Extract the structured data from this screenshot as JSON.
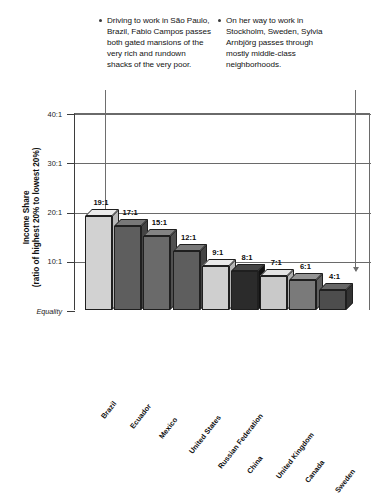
{
  "chart_data": {
    "type": "bar",
    "title": "",
    "xlabel": "",
    "ylabel": "Income Share",
    "ylabel_sub": "(ratio of highest 20% to lowest 20%)",
    "categories": [
      "Brazil",
      "Ecuador",
      "Mexico",
      "United States",
      "Russian Federation",
      "China",
      "United Kingdom",
      "Canada",
      "Sweden"
    ],
    "values": [
      19,
      17,
      15,
      12,
      9,
      8,
      7,
      6,
      4
    ],
    "value_labels": [
      "19:1",
      "17:1",
      "15:1",
      "12:1",
      "9:1",
      "8:1",
      "7:1",
      "6:1",
      "4:1"
    ],
    "ylim": [
      0,
      40
    ],
    "ytick_values": [
      40,
      30,
      20,
      10,
      0
    ],
    "ytick_labels": [
      "40:1",
      "30:1",
      "20:1",
      "10:1",
      "Equality"
    ],
    "grid": true,
    "legend": "none",
    "bar_colors": [
      "#d2d2d2",
      "#5e5e5e",
      "#6a6a6a",
      "#5e5e5e",
      "#cfcfcf",
      "#2b2b2b",
      "#c9c9c9",
      "#7a7a7a",
      "#4d4d4d"
    ],
    "annotations": [
      {
        "id": "brazil-callout",
        "text": "Driving to work in São Paulo, Brazil, Fabio Campos passes both gated mansions of the very rich and rundown shacks of the very poor.",
        "points_to": "Brazil"
      },
      {
        "id": "sweden-callout",
        "text": "On her way to work in Stockholm, Sweden, Sylvia Arnbjörg passes through mostly middle-class neighborhoods.",
        "points_to": "Sweden"
      }
    ]
  },
  "callouts": {
    "brazil": "Driving to work in São Paulo, Brazil, Fabio Campos passes both gated mansions of the very rich and rundown shacks of the very poor.",
    "sweden": "On her way to work in Stockholm, Sweden, Sylvia Arnbjörg passes through mostly middle-class neighborhoods."
  }
}
